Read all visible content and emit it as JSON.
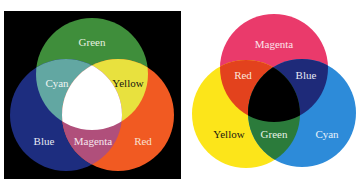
{
  "additive": {
    "title": "Additive (RGB) color mixing",
    "background": "#000000",
    "primaries": [
      {
        "name": "Green",
        "color": "#3f8e3b",
        "label_color": "#e8f0e0"
      },
      {
        "name": "Blue",
        "color": "#1d2d7f",
        "label_color": "#e6e8f2"
      },
      {
        "name": "Red",
        "color": "#f15a22",
        "label_color": "#f8e0d0"
      }
    ],
    "overlaps": [
      {
        "name": "Cyan",
        "color": "#62a7a2",
        "label_color": "#eef4f2"
      },
      {
        "name": "Yellow",
        "color": "#e8e13e",
        "label_color": "#1a1a10"
      },
      {
        "name": "Magenta",
        "color": "#b04f7b",
        "label_color": "#f6e6ee"
      }
    ],
    "center": {
      "name": "White",
      "color": "#ffffff"
    }
  },
  "subtractive": {
    "title": "Subtractive (CMY) color mixing",
    "background": "#ffffff",
    "primaries": [
      {
        "name": "Magenta",
        "color": "#ea3a6b",
        "label_color": "#fbe4ea"
      },
      {
        "name": "Yellow",
        "color": "#fce51a",
        "label_color": "#1a1a10"
      },
      {
        "name": "Cyan",
        "color": "#2d8bd9",
        "label_color": "#e8f2fb"
      }
    ],
    "overlaps": [
      {
        "name": "Red",
        "color": "#e3421d",
        "label_color": "#fbe6dc"
      },
      {
        "name": "Blue",
        "color": "#1e2a79",
        "label_color": "#e6e8f4"
      },
      {
        "name": "Green",
        "color": "#2b7b3b",
        "label_color": "#e6f2e6"
      }
    ],
    "center": {
      "name": "Black",
      "color": "#000000"
    }
  }
}
